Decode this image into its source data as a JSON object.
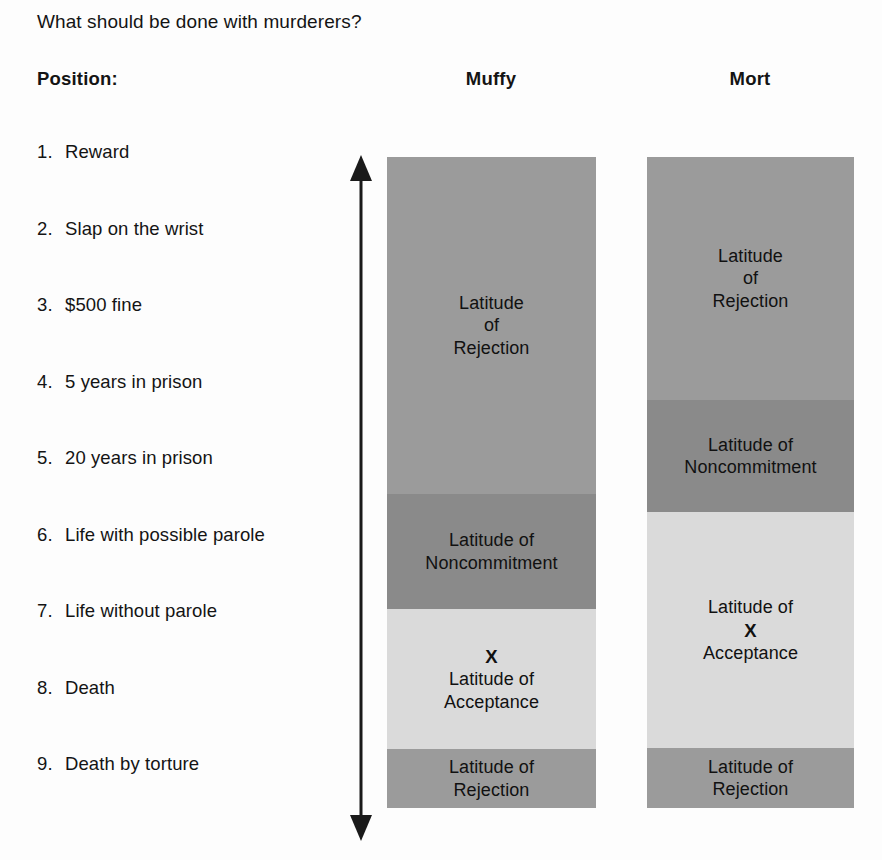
{
  "question": "What should be done with murderers?",
  "position_header": "Position:",
  "columns": [
    {
      "id": "muffy",
      "header": "Muffy"
    },
    {
      "id": "mort",
      "header": "Mort"
    }
  ],
  "positions": [
    {
      "num": "1.",
      "text": "Reward"
    },
    {
      "num": "2.",
      "text": "Slap on the wrist"
    },
    {
      "num": "3.",
      "text": "$500 fine"
    },
    {
      "num": "4.",
      "text": "5 years in prison"
    },
    {
      "num": "5.",
      "text": "20 years in prison"
    },
    {
      "num": "6.",
      "text": "Life with possible parole"
    },
    {
      "num": "7.",
      "text": "Life without parole"
    },
    {
      "num": "8.",
      "text": "Death"
    },
    {
      "num": "9.",
      "text": "Death by torture"
    }
  ],
  "arrow": {
    "name": "vertical-double-arrow",
    "color": "#1a1a1a",
    "top_head": "up",
    "bottom_head": "down"
  },
  "colors": {
    "rejection": "#9b9b9b",
    "noncommitment": "#8a8a8a",
    "acceptance": "#dadada",
    "background": "#fdfdfd",
    "text": "#111111"
  },
  "chart_data": {
    "type": "bar",
    "title": "What should be done with murderers?",
    "xlabel": "",
    "ylabel": "Position:",
    "categories": [
      "1. Reward",
      "2. Slap on the wrist",
      "3. $500 fine",
      "4. 5 years in prison",
      "5. 20 years in prison",
      "6. Life with possible parole",
      "7. Life without parole",
      "8. Death",
      "9. Death by torture"
    ],
    "series": [
      {
        "name": "Muffy",
        "bands": [
          {
            "label": "Latitude of Rejection",
            "lines": [
              "Latitude",
              "of",
              "Rejection"
            ],
            "color": "#9b9b9b",
            "start_position": 1,
            "end_position": 5,
            "height_px": 337,
            "marked": false
          },
          {
            "label": "Latitude of Noncommitment",
            "lines": [
              "Latitude of",
              "Noncommitment"
            ],
            "color": "#8a8a8a",
            "start_position": 6,
            "end_position": 6,
            "height_px": 115,
            "marked": false
          },
          {
            "label": "Latitude of Acceptance",
            "lines": [
              "Latitude of",
              "Acceptance"
            ],
            "color": "#dadada",
            "start_position": 7,
            "end_position": 8,
            "height_px": 140,
            "marked": true,
            "mark": "X"
          },
          {
            "label": "Latitude of Rejection",
            "lines": [
              "Latitude of",
              "Rejection"
            ],
            "color": "#9b9b9b",
            "start_position": 9,
            "end_position": 9,
            "height_px": 59,
            "marked": false
          }
        ]
      },
      {
        "name": "Mort",
        "bands": [
          {
            "label": "Latitude of Rejection",
            "lines": [
              "Latitude",
              "of",
              "Rejection"
            ],
            "color": "#9b9b9b",
            "start_position": 1,
            "end_position": 3,
            "height_px": 243,
            "marked": false
          },
          {
            "label": "Latitude of Noncommitment",
            "lines": [
              "Latitude of",
              "Noncommitment"
            ],
            "color": "#8a8a8a",
            "start_position": 4,
            "end_position": 5,
            "height_px": 112,
            "marked": false
          },
          {
            "label": "Latitude of Acceptance",
            "lines": [
              "Latitude of",
              "Acceptance"
            ],
            "color": "#dadada",
            "start_position": 6,
            "end_position": 8,
            "height_px": 236,
            "marked": true,
            "mark": "X"
          },
          {
            "label": "Latitude of Rejection",
            "lines": [
              "Latitude of",
              "Rejection"
            ],
            "color": "#9b9b9b",
            "start_position": 9,
            "end_position": 9,
            "height_px": 60,
            "marked": false
          }
        ]
      }
    ]
  }
}
